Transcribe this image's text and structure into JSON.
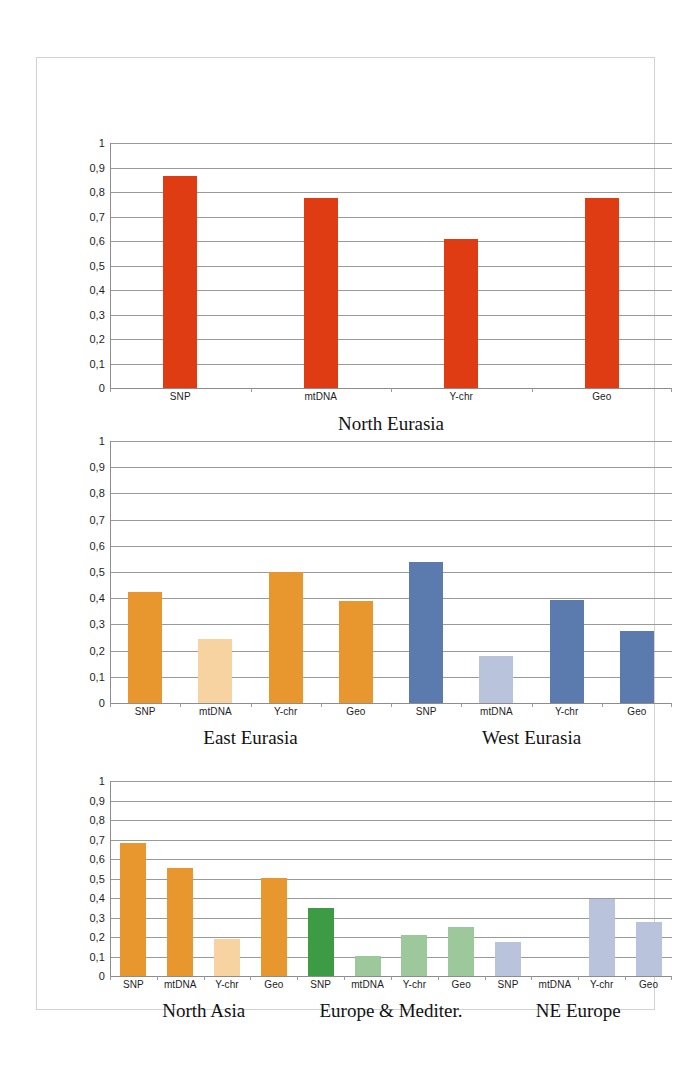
{
  "chart_data": [
    {
      "type": "bar",
      "title": "North Eurasia",
      "categories": [
        "SNP",
        "mtDNA",
        "Y-chr",
        "Geo"
      ],
      "values": [
        0.865,
        0.775,
        0.61,
        0.775
      ],
      "colors": [
        "#E03C14",
        "#E03C14",
        "#E03C14",
        "#E03C14"
      ],
      "xlabel": "",
      "ylabel": "",
      "ylim": [
        0,
        1
      ],
      "yticks": [
        "0",
        "0,1",
        "0,2",
        "0,3",
        "0,4",
        "0,5",
        "0,6",
        "0,7",
        "0,8",
        "0,9",
        "1"
      ],
      "grid": true,
      "legend": "none"
    },
    {
      "type": "bar",
      "title": "East Eurasia / West Eurasia",
      "groups": [
        "East Eurasia",
        "West Eurasia"
      ],
      "categories": [
        "SNP",
        "mtDNA",
        "Y-chr",
        "Geo",
        "SNP",
        "mtDNA",
        "Y-chr",
        "Geo"
      ],
      "values": [
        0.425,
        0.245,
        0.5,
        0.39,
        0.54,
        0.18,
        0.395,
        0.275
      ],
      "colors": [
        "#E8972E",
        "#F6D3A0",
        "#E8972E",
        "#E8972E",
        "#5B7AAE",
        "#B9C4DC",
        "#5B7AAE",
        "#5B7AAE"
      ],
      "xlabel": "",
      "ylabel": "",
      "ylim": [
        0,
        1
      ],
      "yticks": [
        "0",
        "0,1",
        "0,2",
        "0,3",
        "0,4",
        "0,5",
        "0,6",
        "0,7",
        "0,8",
        "0,9",
        "1"
      ],
      "grid": true,
      "legend": "none"
    },
    {
      "type": "bar",
      "title": "North Asia / Europe & Mediter. / NE Europe",
      "groups": [
        "North Asia",
        "Europe & Mediter.",
        "NE Europe"
      ],
      "categories": [
        "SNP",
        "mtDNA",
        "Y-chr",
        "Geo",
        "SNP",
        "mtDNA",
        "Y-chr",
        "Geo",
        "SNP",
        "mtDNA",
        "Y-chr",
        "Geo"
      ],
      "values": [
        0.68,
        0.555,
        0.19,
        0.505,
        0.35,
        0.105,
        0.21,
        0.25,
        0.175,
        0.0,
        0.395,
        0.275
      ],
      "colors": [
        "#E8972E",
        "#E8972E",
        "#F6D3A0",
        "#E8972E",
        "#3C9B44",
        "#9DC89C",
        "#9DC89C",
        "#9DC89C",
        "#B9C4DC",
        "#B9C4DC",
        "#B9C4DC",
        "#B9C4DC"
      ],
      "xlabel": "",
      "ylabel": "",
      "ylim": [
        0,
        1
      ],
      "yticks": [
        "0",
        "0,1",
        "0,2",
        "0,3",
        "0,4",
        "0,5",
        "0,6",
        "0,7",
        "0,8",
        "0,9",
        "1"
      ],
      "grid": true,
      "legend": "none"
    }
  ],
  "panels": [
    {
      "name": "north-eurasia",
      "titles": [
        "North Eurasia"
      ],
      "categories": [
        "SNP",
        "mtDNA",
        "Y-chr",
        "Geo"
      ],
      "yticks": [
        "1",
        "0,9",
        "0,8",
        "0,7",
        "0,6",
        "0,5",
        "0,4",
        "0,3",
        "0,2",
        "0,1",
        "0"
      ]
    },
    {
      "name": "east-west-eurasia",
      "titles": [
        "East Eurasia",
        "West Eurasia"
      ],
      "categories": [
        "SNP",
        "mtDNA",
        "Y-chr",
        "Geo",
        "SNP",
        "mtDNA",
        "Y-chr",
        "Geo"
      ],
      "yticks": [
        "1",
        "0,9",
        "0,8",
        "0,7",
        "0,6",
        "0,5",
        "0,4",
        "0,3",
        "0,2",
        "0,1",
        "0"
      ]
    },
    {
      "name": "north-asia-europe-ne-europe",
      "titles": [
        "North Asia",
        "Europe & Mediter.",
        "NE Europe"
      ],
      "categories": [
        "SNP",
        "mtDNA",
        "Y-chr",
        "Geo",
        "SNP",
        "mtDNA",
        "Y-chr",
        "Geo",
        "SNP",
        "mtDNA",
        "Y-chr",
        "Geo"
      ],
      "yticks": [
        "1",
        "0,9",
        "0,8",
        "0,7",
        "0,6",
        "0,5",
        "0,4",
        "0,3",
        "0,2",
        "0,1",
        "0"
      ]
    }
  ]
}
